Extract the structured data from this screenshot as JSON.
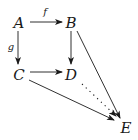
{
  "diagram": {
    "type": "commutative-diagram",
    "nodes": [
      {
        "id": "A",
        "label": "A",
        "x": 19,
        "y": 23
      },
      {
        "id": "B",
        "label": "B",
        "x": 71,
        "y": 23
      },
      {
        "id": "C",
        "label": "C",
        "x": 19,
        "y": 75
      },
      {
        "id": "D",
        "label": "D",
        "x": 71,
        "y": 75
      },
      {
        "id": "E",
        "label": "E",
        "x": 126,
        "y": 128
      }
    ],
    "edges": [
      {
        "from": "A",
        "to": "B",
        "label": "f",
        "style": "solid"
      },
      {
        "from": "A",
        "to": "C",
        "label": "g",
        "style": "solid"
      },
      {
        "from": "B",
        "to": "D",
        "label": "",
        "style": "solid"
      },
      {
        "from": "C",
        "to": "D",
        "label": "",
        "style": "solid"
      },
      {
        "from": "B",
        "to": "E",
        "label": "",
        "style": "solid"
      },
      {
        "from": "C",
        "to": "E",
        "label": "",
        "style": "solid"
      },
      {
        "from": "D",
        "to": "E",
        "label": "",
        "style": "dotted"
      }
    ],
    "labels": {
      "A": "A",
      "B": "B",
      "C": "C",
      "D": "D",
      "E": "E",
      "f": "f",
      "g": "g"
    }
  }
}
